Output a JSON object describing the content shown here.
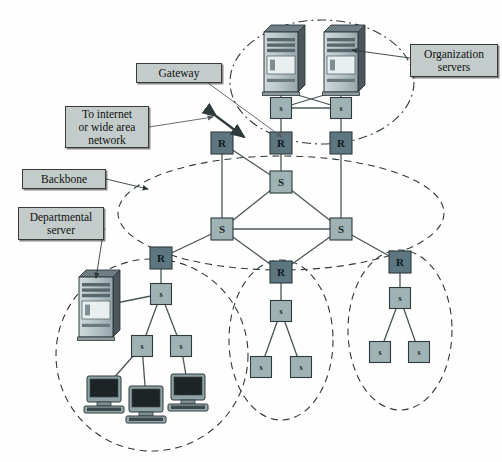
{
  "diagram": {
    "colors": {
      "router_fill": "#5d7680",
      "switch_fill": "#9fb3b5",
      "switch_dark_fill": "#90a7ab",
      "label_fill": "#c3ccca",
      "line": "#4a5558",
      "outline": "#2f3a3d",
      "server_body": "#b9c6c9",
      "server_side": "#4c565c",
      "pc_screen": "#1c2426",
      "pc_body": "#8fa3a6"
    },
    "callouts": [
      {
        "id": "gateway",
        "text": "Gateway",
        "x": 136,
        "y": 63,
        "w": 86,
        "h": 20
      },
      {
        "id": "internet",
        "text": "To internet\nor wide area\nnetwork",
        "x": 65,
        "y": 106,
        "w": 84,
        "h": 42
      },
      {
        "id": "backbone",
        "text": "Backbone",
        "x": 22,
        "y": 169,
        "w": 84,
        "h": 20
      },
      {
        "id": "departmental",
        "text": "Departmental\nserver",
        "x": 18,
        "y": 207,
        "w": 86,
        "h": 33
      },
      {
        "id": "organization",
        "text": "Organization\nservers",
        "x": 410,
        "y": 44,
        "w": 88,
        "h": 33
      }
    ],
    "nodes": [
      {
        "id": "org-s-left",
        "label": "s",
        "kind": "switch",
        "x": 281,
        "y": 108,
        "size": 21
      },
      {
        "id": "org-s-right",
        "label": "s",
        "kind": "switch",
        "x": 341,
        "y": 108,
        "size": 21
      },
      {
        "id": "r-top-left",
        "label": "R",
        "kind": "router",
        "x": 222,
        "y": 143,
        "size": 22
      },
      {
        "id": "r-top-mid",
        "label": "R",
        "kind": "router",
        "x": 281,
        "y": 143,
        "size": 22
      },
      {
        "id": "r-top-right",
        "label": "R",
        "kind": "router",
        "x": 341,
        "y": 143,
        "size": 22
      },
      {
        "id": "bb-s-top",
        "label": "S",
        "kind": "switch",
        "x": 281,
        "y": 182,
        "size": 22
      },
      {
        "id": "bb-s-left",
        "label": "S",
        "kind": "switch",
        "x": 222,
        "y": 229,
        "size": 22
      },
      {
        "id": "bb-s-right",
        "label": "S",
        "kind": "switch",
        "x": 341,
        "y": 229,
        "size": 22
      },
      {
        "id": "r-bot-left",
        "label": "R",
        "kind": "router",
        "x": 161,
        "y": 258,
        "size": 22
      },
      {
        "id": "r-bot-mid",
        "label": "R",
        "kind": "router",
        "x": 281,
        "y": 272,
        "size": 22
      },
      {
        "id": "r-bot-right",
        "label": "R",
        "kind": "router",
        "x": 400,
        "y": 262,
        "size": 22
      },
      {
        "id": "dept-s-main",
        "label": "s",
        "kind": "switch",
        "x": 161,
        "y": 294,
        "size": 21
      },
      {
        "id": "dept-s-a",
        "label": "s",
        "kind": "switch",
        "x": 142,
        "y": 346,
        "size": 21
      },
      {
        "id": "dept-s-b",
        "label": "s",
        "kind": "switch",
        "x": 181,
        "y": 346,
        "size": 21
      },
      {
        "id": "mid-s-main",
        "label": "s",
        "kind": "switch",
        "x": 281,
        "y": 311,
        "size": 21
      },
      {
        "id": "mid-s-a",
        "label": "s",
        "kind": "switch",
        "x": 261,
        "y": 367,
        "size": 21
      },
      {
        "id": "mid-s-b",
        "label": "s",
        "kind": "switch",
        "x": 301,
        "y": 367,
        "size": 21
      },
      {
        "id": "right-s-main",
        "label": "s",
        "kind": "switch",
        "x": 400,
        "y": 298,
        "size": 21
      },
      {
        "id": "right-s-a",
        "label": "s",
        "kind": "switch",
        "x": 380,
        "y": 352,
        "size": 21
      },
      {
        "id": "right-s-b",
        "label": "s",
        "kind": "switch",
        "x": 419,
        "y": 352,
        "size": 21
      }
    ],
    "servers": [
      {
        "id": "org-server-left",
        "x": 281,
        "y": 62,
        "w": 34,
        "h": 60
      },
      {
        "id": "org-server-right",
        "x": 341,
        "y": 62,
        "w": 34,
        "h": 60
      },
      {
        "id": "dept-server",
        "x": 96,
        "y": 307,
        "w": 34,
        "h": 60
      }
    ],
    "workstations": [
      {
        "id": "pc-left",
        "x": 104,
        "y": 389
      },
      {
        "id": "pc-middle",
        "x": 146,
        "y": 399
      },
      {
        "id": "pc-right",
        "x": 188,
        "y": 387
      }
    ],
    "groups": [
      {
        "id": "organization-servers-group",
        "style": "dashdot",
        "cx": 322,
        "cy": 82,
        "rx": 92,
        "ry": 62
      },
      {
        "id": "backbone-group",
        "style": "dashed",
        "cx": 281,
        "cy": 213,
        "rx": 163,
        "ry": 57
      },
      {
        "id": "departmental-lan-group",
        "style": "dashed",
        "cx": 152,
        "cy": 355,
        "rx": 96,
        "ry": 96
      },
      {
        "id": "middle-lan-group",
        "style": "dashed",
        "cx": 281,
        "cy": 340,
        "rx": 52,
        "ry": 80
      },
      {
        "id": "right-lan-group",
        "style": "dashed",
        "cx": 400,
        "cy": 330,
        "rx": 52,
        "ry": 80
      }
    ],
    "links": [
      [
        "org-server-left-foot",
        "org-s-left"
      ],
      [
        "org-server-right-foot",
        "org-s-right"
      ],
      [
        "org-server-left-foot",
        "org-s-right"
      ],
      [
        "org-server-right-foot",
        "org-s-left"
      ],
      [
        "org-s-left",
        "org-s-right"
      ],
      [
        "org-s-left",
        "r-top-mid"
      ],
      [
        "org-s-right",
        "r-top-right"
      ],
      [
        "r-top-left",
        "bb-s-left"
      ],
      [
        "r-top-left",
        "bb-s-top"
      ],
      [
        "r-top-mid",
        "bb-s-top"
      ],
      [
        "r-top-right",
        "bb-s-right"
      ],
      [
        "bb-s-top",
        "bb-s-left"
      ],
      [
        "bb-s-top",
        "bb-s-right"
      ],
      [
        "bb-s-left",
        "bb-s-right"
      ],
      [
        "bb-s-left",
        "r-bot-left"
      ],
      [
        "bb-s-left",
        "r-bot-mid"
      ],
      [
        "bb-s-right",
        "r-bot-mid"
      ],
      [
        "bb-s-right",
        "r-bot-right"
      ],
      [
        "r-bot-left",
        "dept-s-main"
      ],
      [
        "dept-server",
        "dept-s-main"
      ],
      [
        "dept-s-main",
        "dept-s-a"
      ],
      [
        "dept-s-main",
        "dept-s-b"
      ],
      [
        "dept-s-a",
        "pc-left"
      ],
      [
        "dept-s-a",
        "pc-middle"
      ],
      [
        "dept-s-b",
        "pc-right"
      ],
      [
        "r-bot-mid",
        "mid-s-main"
      ],
      [
        "mid-s-main",
        "mid-s-a"
      ],
      [
        "mid-s-main",
        "mid-s-b"
      ],
      [
        "r-bot-right",
        "right-s-main"
      ],
      [
        "right-s-main",
        "right-s-a"
      ],
      [
        "right-s-main",
        "right-s-b"
      ]
    ]
  }
}
